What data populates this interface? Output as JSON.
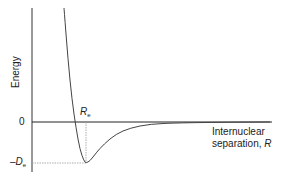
{
  "chart_data": {
    "type": "line",
    "title": "",
    "xlabel": "Internuclear separation, R",
    "ylabel": "Energy",
    "y_ticks": [
      "0",
      "-De"
    ],
    "x_annotations": [
      "Re"
    ],
    "series": [
      {
        "name": "Potential energy curve",
        "description": "Morse-like potential: steep repulsive wall at small R, minimum of depth -De at R = Re, asymptotically approaches 0 at large R",
        "points_px": [
          [
            64,
            8
          ],
          [
            68,
            60
          ],
          [
            72,
            100
          ],
          [
            76,
            128
          ],
          [
            80,
            150
          ],
          [
            84,
            161
          ],
          [
            86,
            163
          ],
          [
            90,
            161
          ],
          [
            96,
            153
          ],
          [
            104,
            144
          ],
          [
            116,
            134
          ],
          [
            130,
            128
          ],
          [
            150,
            124
          ],
          [
            180,
            122.8
          ],
          [
            230,
            122.2
          ],
          [
            270,
            122
          ]
        ]
      }
    ],
    "grid": false,
    "legend": "none"
  },
  "labels": {
    "energy": "Energy",
    "zero": "0",
    "re_main": "R",
    "re_sub": "e",
    "de_main": "–D",
    "de_sub": "e",
    "xlabel_line1": "Internuclear",
    "xlabel_line2": "separation, ",
    "xlabel_var": "R"
  }
}
